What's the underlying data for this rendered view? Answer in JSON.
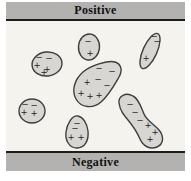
{
  "apparatus": {
    "top_plate_label": "Positive",
    "bottom_plate_label": "Negative"
  },
  "colors": {
    "page_background": "#ffffff",
    "plate_fill": "#b3b2b0",
    "plate_border": "#1c1c1c",
    "field_background": "#f5f3ee",
    "blob_fill": "#d8d6d2",
    "blob_stroke": "#3e3e3e",
    "charge_color": "#222222"
  },
  "diagram": {
    "blobs": [
      {
        "name": "particle-top-left",
        "shape": {
          "type": "ellipse",
          "cx": 41,
          "cy": 43,
          "rx": 15,
          "ry": 12,
          "rotate": -6
        },
        "charges": [
          {
            "sign": "−",
            "x": 33,
            "y": 36
          },
          {
            "sign": "−",
            "x": 43,
            "y": 37
          },
          {
            "sign": "+",
            "x": 31,
            "y": 44
          },
          {
            "sign": "+",
            "x": 41,
            "y": 48
          },
          {
            "sign": "+",
            "x": 38,
            "y": 51
          }
        ]
      },
      {
        "name": "particle-top-middle",
        "shape": {
          "type": "ellipse",
          "cx": 83,
          "cy": 26,
          "rx": 10.5,
          "ry": 13,
          "rotate": 4
        },
        "charges": [
          {
            "sign": "−",
            "x": 82,
            "y": 20
          },
          {
            "sign": "+",
            "x": 84,
            "y": 32
          }
        ]
      },
      {
        "name": "particle-top-right",
        "shape": {
          "type": "ellipse",
          "cx": 144,
          "cy": 30,
          "rx": 7,
          "ry": 19,
          "rotate": 24
        },
        "charges": [
          {
            "sign": "−",
            "x": 148,
            "y": 15
          },
          {
            "sign": "−",
            "x": 151,
            "y": 20
          },
          {
            "sign": "+",
            "x": 140,
            "y": 37
          }
        ]
      },
      {
        "name": "particle-center",
        "shape": {
          "type": "path",
          "d": "M 109,41 C 115,43 117,49 113,56 C 109,63 103,74 95,81 C 87,88 75,87 70,78 C 65,69 69,58 77,51 C 85,44 103,39 109,41 Z"
        },
        "charges": [
          {
            "sign": "−",
            "x": 93,
            "y": 47
          },
          {
            "sign": "−",
            "x": 106,
            "y": 50
          },
          {
            "sign": "−",
            "x": 92,
            "y": 58
          },
          {
            "sign": "−",
            "x": 101,
            "y": 64
          },
          {
            "sign": "+",
            "x": 81,
            "y": 61
          },
          {
            "sign": "+",
            "x": 75,
            "y": 72
          },
          {
            "sign": "+",
            "x": 84,
            "y": 75
          },
          {
            "sign": "+",
            "x": 93,
            "y": 74
          }
        ]
      },
      {
        "name": "particle-left",
        "shape": {
          "type": "ellipse",
          "cx": 26,
          "cy": 90,
          "rx": 13,
          "ry": 12,
          "rotate": 0
        },
        "charges": [
          {
            "sign": "−",
            "x": 19,
            "y": 83
          },
          {
            "sign": "−",
            "x": 28,
            "y": 84
          },
          {
            "sign": "+",
            "x": 18,
            "y": 91
          },
          {
            "sign": "+",
            "x": 28,
            "y": 92
          }
        ]
      },
      {
        "name": "particle-bottom-middle",
        "shape": {
          "type": "path",
          "d": "M 72,95 C 77,96 81,102 82,110 C 83,119 79,127 71,127 C 63,127 59,119 60,111 C 61,103 66,94 72,95 Z"
        },
        "charges": [
          {
            "sign": "−",
            "x": 71,
            "y": 102
          },
          {
            "sign": "−",
            "x": 69,
            "y": 107
          },
          {
            "sign": "+",
            "x": 65,
            "y": 116
          },
          {
            "sign": "+",
            "x": 75,
            "y": 116
          }
        ]
      },
      {
        "name": "particle-bottom-right",
        "shape": {
          "type": "path",
          "d": "M 113,82 C 112,75 120,71 127,75 C 133,78 135,86 138,93 C 141,100 148,103 153,109 C 158,115 158,123 151,126 C 144,129 137,125 134,118 C 131,111 127,105 122,99 C 117,93 114,89 113,82 Z"
        },
        "charges": [
          {
            "sign": "−",
            "x": 124,
            "y": 83
          },
          {
            "sign": "−",
            "x": 129,
            "y": 91
          },
          {
            "sign": "−",
            "x": 134,
            "y": 99
          },
          {
            "sign": "+",
            "x": 142,
            "y": 104
          },
          {
            "sign": "+",
            "x": 149,
            "y": 111
          },
          {
            "sign": "+",
            "x": 144,
            "y": 118
          }
        ]
      }
    ]
  }
}
